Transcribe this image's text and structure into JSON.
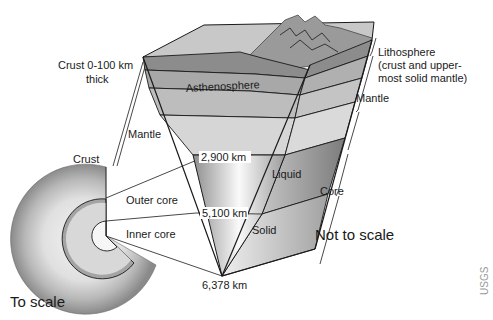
{
  "diagram": {
    "labels": {
      "crust_thickness": [
        "Crust 0-100 km",
        "thick"
      ],
      "mantle_left": "Mantle",
      "crust_left": "Crust",
      "asthenosphere": "Asthenosphere",
      "lithosphere": [
        "Lithosphere",
        "(crust and upper-",
        "most solid mantle)"
      ],
      "mantle_right": "Mantle",
      "depth_2900": "2,900 km",
      "liquid": "Liquid",
      "core_right": "Core",
      "outer_core": "Outer core",
      "depth_5100": "5,100 km",
      "solid": "Solid",
      "inner_core": "Inner core",
      "not_to_scale": "Not to scale",
      "depth_6378": "6,378 km",
      "to_scale": "To scale",
      "credit": "USGS"
    },
    "colors": {
      "mantle": "#cfcfcf",
      "asthenosphere": "#a8a8a8",
      "crust": "#8c8c8c",
      "outer_core": "#9a9a9a",
      "inner_core": "#e6e6e6",
      "outline": "#1a1a1a"
    }
  }
}
